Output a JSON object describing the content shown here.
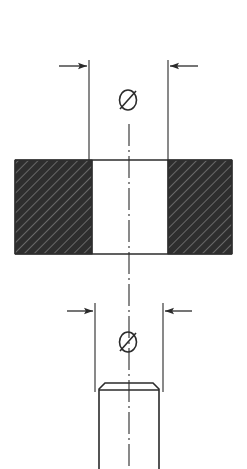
{
  "drawing": {
    "title": "Sectional assembly drawing of die block and punch",
    "background_color": "#ffffff",
    "line_color": "#2b2b2b",
    "hatch_fill_color": "#2e2e2e",
    "hatch_line_color": "#6a6a6a",
    "width": 247,
    "height": 469
  },
  "upper_dimension": {
    "name": "upper-diameter-dimension",
    "symbol": "Ø",
    "symbol_label": "diameter-symbol",
    "value_text": "",
    "left_arrow_label": "arrow-right-pointing",
    "right_arrow_label": "arrow-left-pointing",
    "extension_left_x": 89,
    "extension_right_x": 168,
    "dimension_line_y": 66,
    "symbol_x": 128,
    "symbol_y": 105
  },
  "lower_dimension": {
    "name": "lower-diameter-dimension",
    "symbol": "Ø",
    "symbol_label": "diameter-symbol",
    "value_text": "",
    "left_arrow_label": "arrow-right-pointing",
    "right_arrow_label": "arrow-left-pointing",
    "extension_left_x": 95,
    "extension_right_x": 163,
    "dimension_line_y": 311,
    "symbol_x": 128,
    "symbol_y": 347
  },
  "die_block": {
    "name": "hatched-die-block",
    "left_x": 15,
    "right_x": 232,
    "top_y": 160,
    "bottom_y": 254,
    "hole_left_x": 92,
    "hole_right_x": 168,
    "hatch_description": "dense-diagonal-section-hatch"
  },
  "punch": {
    "name": "punch-cylinder",
    "left_x": 99,
    "right_x": 159,
    "top_y": 383,
    "bottom_y": 469,
    "chamfer_size": 6
  },
  "centerline": {
    "name": "vertical-centerline",
    "x": 129,
    "top_y": 124,
    "bottom_y": 469,
    "style": "dash-dot"
  }
}
